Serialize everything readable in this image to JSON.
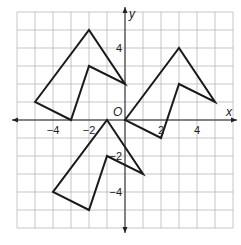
{
  "figure": {
    "x_axis_label": "x",
    "y_axis_label": "y",
    "origin_label": "O",
    "x_tick_labels": [
      {
        "value": -4,
        "text": "−4"
      },
      {
        "value": -2,
        "text": "−2"
      },
      {
        "value": 2,
        "text": "2"
      },
      {
        "value": 4,
        "text": "4"
      }
    ],
    "y_tick_labels": [
      {
        "value": 4,
        "text": "4"
      },
      {
        "value": -2,
        "text": "−2"
      },
      {
        "value": -4,
        "text": "−4"
      }
    ],
    "grid": {
      "xmin": -6,
      "xmax": 6,
      "ymin": -6,
      "ymax": 6,
      "step": 1
    },
    "shapes": [
      {
        "name": "figure-upper-left",
        "points": [
          [
            -5,
            1
          ],
          [
            -2,
            5
          ],
          [
            0,
            2
          ],
          [
            -2,
            3
          ],
          [
            -3,
            0
          ]
        ]
      },
      {
        "name": "figure-upper-right",
        "points": [
          [
            0,
            0
          ],
          [
            3,
            4
          ],
          [
            5,
            1
          ],
          [
            3,
            2
          ],
          [
            2,
            -1
          ]
        ]
      },
      {
        "name": "figure-lower",
        "points": [
          [
            -1,
            0
          ],
          [
            1,
            -3
          ],
          [
            -1,
            -2
          ],
          [
            -2,
            -5
          ],
          [
            -4,
            -4
          ]
        ]
      }
    ],
    "colors": {
      "grid": "#b8b8b8",
      "shape": "#1a1a1a",
      "axis": "#222222"
    }
  }
}
